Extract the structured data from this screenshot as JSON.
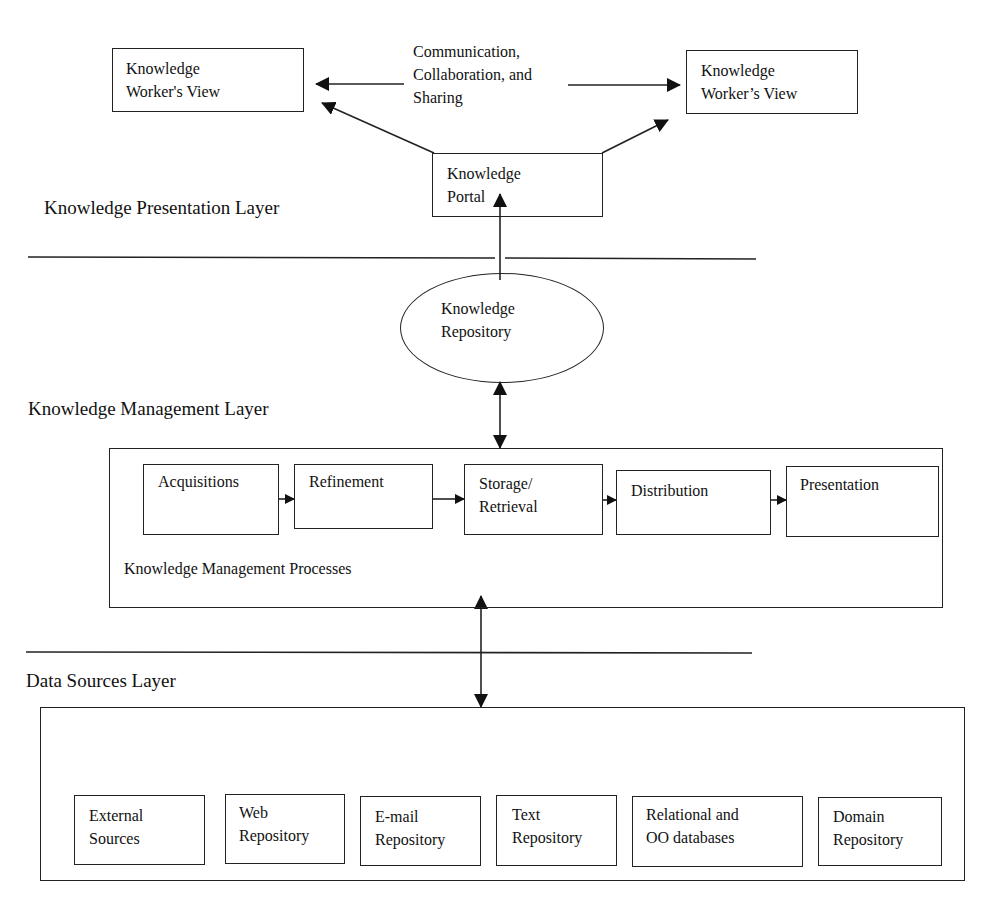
{
  "presentation_layer": {
    "label": "Knowledge Presentation Layer",
    "worker_view_left": "Knowledge\nWorker's View",
    "worker_view_right": "Knowledge\nWorker’s View",
    "communication_label": "Communication,\nCollaboration, and\nSharing",
    "portal": "Knowledge\nPortal"
  },
  "repository": {
    "label": "Knowledge\nRepository"
  },
  "management_layer": {
    "label": "Knowledge Management Layer",
    "processes_label": "Knowledge Management Processes",
    "processes": [
      {
        "label": "Acquisitions"
      },
      {
        "label": "Refinement"
      },
      {
        "label": "Storage/\nRetrieval"
      },
      {
        "label": "Distribution"
      },
      {
        "label": "Presentation"
      }
    ]
  },
  "data_sources_layer": {
    "label": "Data Sources Layer",
    "sources": [
      {
        "label": "External\nSources"
      },
      {
        "label": "Web\nRepository"
      },
      {
        "label": "E-mail\nRepository"
      },
      {
        "label": "Text\nRepository"
      },
      {
        "label": "Relational and\nOO databases"
      },
      {
        "label": "Domain\nRepository"
      }
    ]
  },
  "colors": {
    "line": "#222222",
    "background": "#ffffff"
  }
}
